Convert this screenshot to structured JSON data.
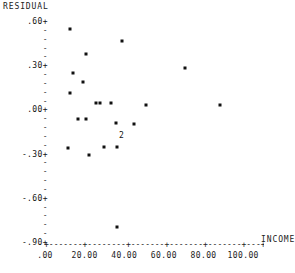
{
  "chart_data": {
    "type": "scatter",
    "title": "",
    "xlabel": "INCOME",
    "ylabel": "RESIDUAL",
    "xlim": [
      0,
      110
    ],
    "ylim": [
      -0.9,
      0.6
    ],
    "grid": false,
    "legend": null,
    "x_ticks": [
      {
        "value": 0,
        "label": ".00"
      },
      {
        "value": 20,
        "label": "20.00"
      },
      {
        "value": 40,
        "label": "40.00"
      },
      {
        "value": 60,
        "label": "60.00"
      },
      {
        "value": 80,
        "label": "80.00"
      },
      {
        "value": 100,
        "label": "100.00"
      }
    ],
    "y_ticks": [
      {
        "value": 0.6,
        "label": ".60+"
      },
      {
        "value": 0.3,
        "label": ".30+"
      },
      {
        "value": 0.0,
        "label": ".00+"
      },
      {
        "value": -0.3,
        "label": "-.30+"
      },
      {
        "value": -0.6,
        "label": "-.60+"
      },
      {
        "value": -0.9,
        "label": "-.90+"
      }
    ],
    "y_minor_tick_mark": "-",
    "points": [
      {
        "x": 12.5,
        "y": 0.555,
        "count": 1
      },
      {
        "x": 39.0,
        "y": 0.47,
        "count": 1
      },
      {
        "x": 20.5,
        "y": 0.38,
        "count": 1
      },
      {
        "x": 70.5,
        "y": 0.285,
        "count": 1
      },
      {
        "x": 14.0,
        "y": 0.255,
        "count": 1
      },
      {
        "x": 19.0,
        "y": 0.19,
        "count": 1
      },
      {
        "x": 12.5,
        "y": 0.115,
        "count": 1
      },
      {
        "x": 25.5,
        "y": 0.05,
        "count": 1
      },
      {
        "x": 28.0,
        "y": 0.05,
        "count": 1
      },
      {
        "x": 33.5,
        "y": 0.05,
        "count": 1
      },
      {
        "x": 51.0,
        "y": 0.04,
        "count": 1
      },
      {
        "x": 88.5,
        "y": 0.04,
        "count": 1
      },
      {
        "x": 16.5,
        "y": -0.055,
        "count": 1
      },
      {
        "x": 20.5,
        "y": -0.055,
        "count": 1
      },
      {
        "x": 36.0,
        "y": -0.085,
        "count": 1
      },
      {
        "x": 45.0,
        "y": -0.095,
        "count": 1
      },
      {
        "x": 38.5,
        "y": -0.175,
        "count": 2
      },
      {
        "x": 11.5,
        "y": -0.255,
        "count": 1
      },
      {
        "x": 30.0,
        "y": -0.25,
        "count": 1
      },
      {
        "x": 36.5,
        "y": -0.25,
        "count": 1
      },
      {
        "x": 22.0,
        "y": -0.3,
        "count": 1
      },
      {
        "x": 36.5,
        "y": -0.79,
        "count": 1
      }
    ]
  }
}
